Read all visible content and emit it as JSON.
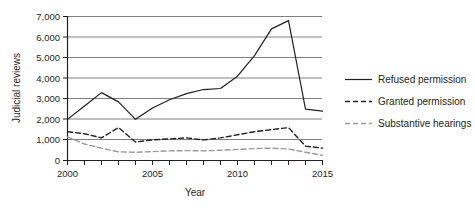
{
  "chart_data": {
    "type": "line",
    "title": "",
    "xlabel": "Year",
    "ylabel": "Judicial reviews",
    "xlim": [
      2000,
      2015
    ],
    "ylim": [
      0,
      7000
    ],
    "grid": true,
    "legend_position": "right",
    "x": [
      2000,
      2001,
      2002,
      2003,
      2004,
      2005,
      2006,
      2007,
      2008,
      2009,
      2010,
      2011,
      2012,
      2013,
      2014,
      2015
    ],
    "xtick_labels": [
      "2000",
      "2005",
      "2010",
      "2015"
    ],
    "xtick_values": [
      2000,
      2005,
      2010,
      2015
    ],
    "ytick_labels": [
      "0",
      "1,000",
      "2,000",
      "3,000",
      "4,000",
      "5,000",
      "6,000",
      "7,000"
    ],
    "ytick_values": [
      0,
      1000,
      2000,
      3000,
      4000,
      5000,
      6000,
      7000
    ],
    "series": [
      {
        "name": "Refused permission",
        "style": "solid",
        "color": "#231f20",
        "values": [
          2000,
          2650,
          3300,
          2850,
          2000,
          2550,
          2950,
          3250,
          3450,
          3500,
          4100,
          5100,
          6400,
          6800,
          2500,
          2400
        ]
      },
      {
        "name": "Granted permission",
        "style": "dashed",
        "color": "#231f20",
        "values": [
          1400,
          1300,
          1100,
          1600,
          900,
          1000,
          1050,
          1100,
          1000,
          1100,
          1250,
          1400,
          1500,
          1600,
          700,
          600
        ]
      },
      {
        "name": "Substantive hearings",
        "style": "dashed",
        "color": "#9a9a9a",
        "values": [
          1150,
          800,
          600,
          420,
          400,
          430,
          470,
          480,
          470,
          500,
          540,
          580,
          600,
          560,
          400,
          250
        ]
      }
    ]
  },
  "axes": {
    "y_axis_title": "Judicial reviews",
    "x_axis_title": "Year"
  },
  "legend": {
    "items": [
      {
        "label": "Refused permission",
        "style": "solid",
        "color": "#231f20"
      },
      {
        "label": "Granted permission",
        "style": "dashed",
        "color": "#231f20"
      },
      {
        "label": "Substantive hearings",
        "style": "dashed",
        "color": "#9a9a9a"
      }
    ]
  },
  "colors": {
    "grid": "#808080",
    "axis": "#231f20",
    "text": "#231f20",
    "series_light": "#9a9a9a"
  }
}
